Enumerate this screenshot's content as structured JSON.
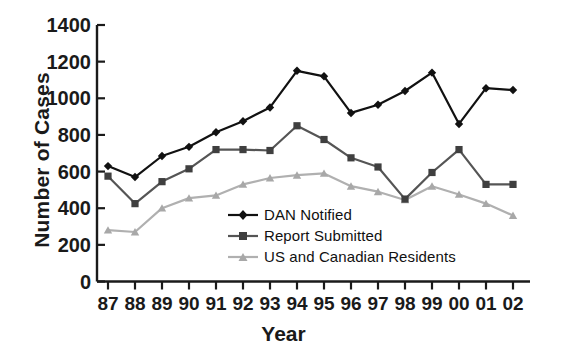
{
  "chart_data": {
    "type": "line",
    "title": "",
    "xlabel": "Year",
    "ylabel": "Number of Cases",
    "categories": [
      "87",
      "88",
      "89",
      "90",
      "91",
      "92",
      "93",
      "94",
      "95",
      "96",
      "97",
      "98",
      "99",
      "00",
      "01",
      "02"
    ],
    "ylim": [
      0,
      1400
    ],
    "yticks": [
      0,
      200,
      400,
      600,
      800,
      1000,
      1200,
      1400
    ],
    "grid": false,
    "legend_position": "inside-center",
    "series": [
      {
        "name": "DAN Notified",
        "color": "#111111",
        "marker": "diamond",
        "values": [
          630,
          570,
          685,
          735,
          815,
          875,
          950,
          1150,
          1120,
          920,
          965,
          1040,
          1140,
          860,
          1055,
          1045
        ]
      },
      {
        "name": "Report Submitted",
        "color": "#555555",
        "marker": "square",
        "values": [
          575,
          425,
          545,
          615,
          720,
          720,
          715,
          850,
          775,
          675,
          625,
          450,
          595,
          720,
          530,
          530
        ]
      },
      {
        "name": "US and Canadian Residents",
        "color": "#b0b0b0",
        "marker": "triangle",
        "values": [
          280,
          270,
          400,
          455,
          470,
          530,
          565,
          580,
          590,
          520,
          490,
          445,
          520,
          475,
          425,
          360
        ]
      }
    ]
  },
  "axes": {
    "ytick_labels": [
      "1400",
      "1200",
      "1000",
      "800",
      "600",
      "400",
      "200",
      "0"
    ],
    "xtick_labels": [
      "87",
      "88",
      "89",
      "90",
      "91",
      "92",
      "93",
      "94",
      "95",
      "96",
      "97",
      "98",
      "99",
      "00",
      "01",
      "02"
    ]
  },
  "legend": {
    "items": [
      {
        "label": "DAN Notified",
        "marker": "diamond-marker-icon",
        "color": "#111111"
      },
      {
        "label": "Report Submitted",
        "marker": "square-marker-icon",
        "color": "#555555"
      },
      {
        "label": "US and Canadian Residents",
        "marker": "triangle-marker-icon",
        "color": "#b0b0b0"
      }
    ]
  }
}
